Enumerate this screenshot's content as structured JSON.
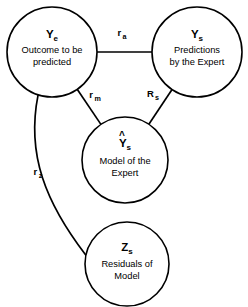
{
  "diagram": {
    "type": "node-link-diagram",
    "background_color": "#ffffff",
    "stroke_color": "#000000",
    "nodes": [
      {
        "id": "Ye",
        "symbol_base": "Y",
        "symbol_sub": "e",
        "label_line1": "Outcome to be",
        "label_line2": "predicted",
        "has_hat": false,
        "cx": 52,
        "cy": 52,
        "r": 45
      },
      {
        "id": "Ys",
        "symbol_base": "Y",
        "symbol_sub": "s",
        "label_line1": "Predictions",
        "label_line2": "by the Expert",
        "has_hat": false,
        "cx": 197,
        "cy": 52,
        "r": 45
      },
      {
        "id": "Yhat_s",
        "symbol_base": "Y",
        "symbol_sub": "s",
        "label_line1": "Model of the",
        "label_line2": "Expert",
        "has_hat": true,
        "cx": 125,
        "cy": 160,
        "r": 43
      },
      {
        "id": "Zs",
        "symbol_base": "Z",
        "symbol_sub": "s",
        "label_line1": "Residuals of",
        "label_line2": "Model",
        "has_hat": false,
        "cx": 127,
        "cy": 264,
        "r": 42
      }
    ],
    "edges": [
      {
        "id": "edge-ra",
        "from": "Ye",
        "to": "Ys",
        "label_base": "r",
        "label_sub": "a",
        "label_x": 122,
        "label_y": 36,
        "shape": "straight"
      },
      {
        "id": "edge-rm",
        "from": "Ye",
        "to": "Yhat_s",
        "label_base": "r",
        "label_sub": "m",
        "label_x": 95,
        "label_y": 98,
        "shape": "straight"
      },
      {
        "id": "edge-Rs",
        "from": "Ys",
        "to": "Yhat_s",
        "label_base": "R",
        "label_sub": "s",
        "label_x": 153,
        "label_y": 97,
        "shape": "straight"
      },
      {
        "id": "edge-rz",
        "from": "Ye",
        "to": "Zs",
        "label_base": "r",
        "label_sub": "z",
        "label_x": 38,
        "label_y": 175,
        "shape": "curved"
      }
    ]
  }
}
